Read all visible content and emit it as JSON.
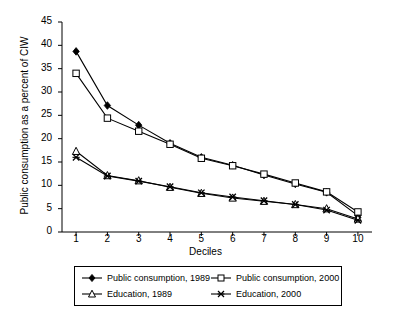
{
  "chart_data": {
    "type": "line",
    "title": "",
    "xlabel": "Deciles",
    "ylabel": "Public consumption as a percent of CIW",
    "categories": [
      "1",
      "2",
      "3",
      "4",
      "5",
      "6",
      "7",
      "8",
      "9",
      "10"
    ],
    "x": [
      1,
      2,
      3,
      4,
      5,
      6,
      7,
      8,
      9,
      10
    ],
    "xlim": [
      0.55,
      10.45
    ],
    "ylim": [
      0,
      45
    ],
    "ytick_values": [
      0,
      5,
      10,
      15,
      20,
      25,
      30,
      35,
      40,
      45
    ],
    "ytick_labels": [
      "0",
      "5",
      "10",
      "15",
      "20",
      "25",
      "30",
      "35",
      "40",
      "45"
    ],
    "xtick_labels": [
      "1",
      "2",
      "3",
      "4",
      "5",
      "6",
      "7",
      "8",
      "9",
      "10"
    ],
    "grid": false,
    "legend_position": "bottom",
    "series": [
      {
        "name": "Public consumption, 1989",
        "marker": "filled-diamond",
        "color": "#000000",
        "values": [
          38.7,
          27.1,
          22.9,
          19.0,
          16.0,
          14.3,
          12.2,
          10.3,
          8.5,
          3.5
        ]
      },
      {
        "name": "Public consumption, 2000",
        "marker": "open-square",
        "color": "#000000",
        "values": [
          34.0,
          24.4,
          21.6,
          18.8,
          15.8,
          14.2,
          12.4,
          10.5,
          8.6,
          4.3
        ]
      },
      {
        "name": "Education, 1989",
        "marker": "open-triangle",
        "color": "#000000",
        "values": [
          17.3,
          12.1,
          11.0,
          9.6,
          8.3,
          7.3,
          6.6,
          5.9,
          5.0,
          2.8
        ]
      },
      {
        "name": "Education, 2000",
        "marker": "x-cross",
        "color": "#000000",
        "values": [
          16.0,
          12.0,
          10.9,
          9.7,
          8.4,
          7.5,
          6.7,
          5.9,
          4.7,
          2.5
        ]
      }
    ]
  },
  "legend": {
    "entries": [
      {
        "label": "Public consumption, 1989",
        "marker": "filled-diamond"
      },
      {
        "label": "Public consumption, 2000",
        "marker": "open-square"
      },
      {
        "label": "Education, 1989",
        "marker": "open-triangle"
      },
      {
        "label": "Education, 2000",
        "marker": "x-cross"
      }
    ]
  },
  "axes": {
    "y_title": "Public consumption as a percent of CIW",
    "x_title": "Deciles"
  }
}
